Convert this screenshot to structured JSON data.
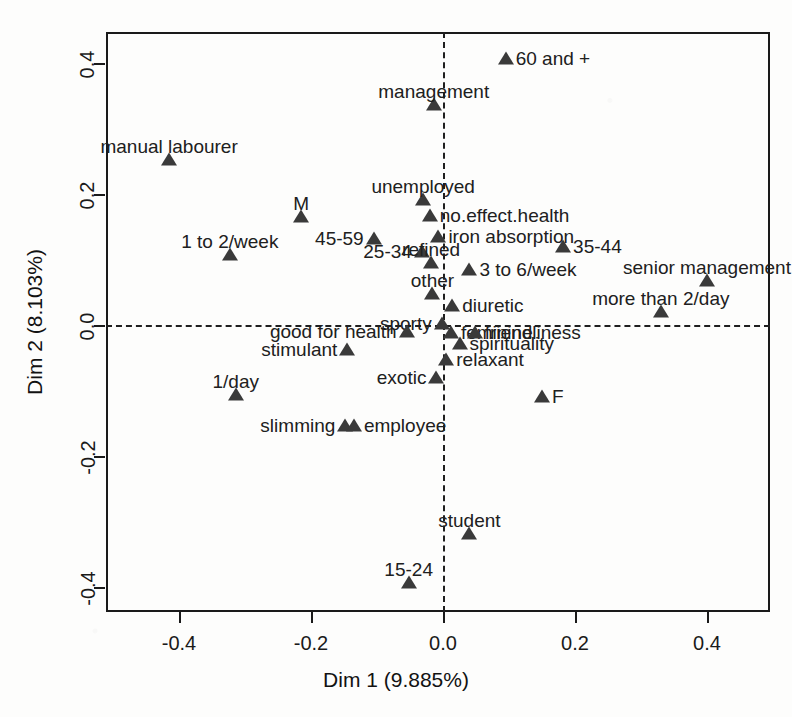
{
  "chart_data": {
    "type": "scatter",
    "title": "",
    "xlabel": "Dim 1 (9.885%)",
    "ylabel": "Dim 2 (8.103%)",
    "xlim": [
      -0.5,
      0.48
    ],
    "ylim": [
      -0.44,
      0.44
    ],
    "xticks": [
      "-0.4",
      "-0.2",
      "0.0",
      "0.2",
      "0.4"
    ],
    "xtick_values": [
      -0.4,
      -0.2,
      0.0,
      0.2,
      0.4
    ],
    "yticks": [
      "-0.4",
      "-0.2",
      "0.0",
      "0.2",
      "0.4"
    ],
    "ytick_values": [
      -0.4,
      -0.2,
      0.0,
      0.2,
      0.4
    ],
    "grid": false,
    "legend": "none",
    "reference_lines": {
      "vertical_at_x": 0.0,
      "horizontal_at_y": 0.0,
      "style": "dashed"
    },
    "marker": "triangle",
    "marker_color": "#3a3a3a",
    "points": [
      {
        "label": "60 and +",
        "x": 0.095,
        "y": 0.405,
        "lab_pos": "right"
      },
      {
        "label": "management",
        "x": -0.014,
        "y": 0.335,
        "lab_pos": "center"
      },
      {
        "label": "manual labourer",
        "x": -0.415,
        "y": 0.25,
        "lab_pos": "center"
      },
      {
        "label": "unemployed",
        "x": -0.03,
        "y": 0.19,
        "lab_pos": "center"
      },
      {
        "label": "M",
        "x": -0.215,
        "y": 0.163,
        "lab_pos": "center"
      },
      {
        "label": "no.effect.health",
        "x": -0.02,
        "y": 0.165,
        "lab_pos": "right"
      },
      {
        "label": "45-59",
        "x": -0.105,
        "y": 0.13,
        "lab_pos": "left"
      },
      {
        "label": "iron absorption",
        "x": -0.007,
        "y": 0.133,
        "lab_pos": "right"
      },
      {
        "label": "1 to 2/week",
        "x": -0.323,
        "y": 0.105,
        "lab_pos": "center"
      },
      {
        "label": "25-34",
        "x": -0.032,
        "y": 0.11,
        "lab_pos": "left"
      },
      {
        "label": "35-44",
        "x": 0.182,
        "y": 0.118,
        "lab_pos": "right"
      },
      {
        "label": "refined",
        "x": -0.018,
        "y": 0.093,
        "lab_pos": "center"
      },
      {
        "label": "3 to 6/week",
        "x": 0.04,
        "y": 0.083,
        "lab_pos": "right"
      },
      {
        "label": "senior management",
        "x": 0.4,
        "y": 0.065,
        "lab_pos": "center"
      },
      {
        "label": "other",
        "x": -0.016,
        "y": 0.046,
        "lab_pos": "center"
      },
      {
        "label": "more than 2/day",
        "x": 0.33,
        "y": 0.018,
        "lab_pos": "center"
      },
      {
        "label": "diuretic",
        "x": 0.014,
        "y": 0.028,
        "lab_pos": "right"
      },
      {
        "label": "sporty",
        "x": -0.002,
        "y": 0.0,
        "lab_pos": "left"
      },
      {
        "label": "good for health",
        "x": -0.055,
        "y": -0.012,
        "lab_pos": "left"
      },
      {
        "label": "feminine",
        "x": 0.012,
        "y": -0.014,
        "lab_pos": "right"
      },
      {
        "label": "friendliness",
        "x": 0.048,
        "y": -0.014,
        "lab_pos": "right"
      },
      {
        "label": "spirituality",
        "x": 0.025,
        "y": -0.03,
        "lab_pos": "right"
      },
      {
        "label": "stimulant",
        "x": -0.145,
        "y": -0.04,
        "lab_pos": "left"
      },
      {
        "label": "relaxant",
        "x": 0.005,
        "y": -0.055,
        "lab_pos": "right"
      },
      {
        "label": "exotic",
        "x": -0.01,
        "y": -0.082,
        "lab_pos": "left"
      },
      {
        "label": "1/day",
        "x": -0.314,
        "y": -0.108,
        "lab_pos": "center"
      },
      {
        "label": "F",
        "x": 0.15,
        "y": -0.112,
        "lab_pos": "right"
      },
      {
        "label": "slimming",
        "x": -0.148,
        "y": -0.155,
        "lab_pos": "left"
      },
      {
        "label": "employee",
        "x": -0.135,
        "y": -0.155,
        "lab_pos": "right"
      },
      {
        "label": "student",
        "x": 0.04,
        "y": -0.32,
        "lab_pos": "center"
      },
      {
        "label": "15-24",
        "x": -0.052,
        "y": -0.395,
        "lab_pos": "center"
      }
    ]
  }
}
